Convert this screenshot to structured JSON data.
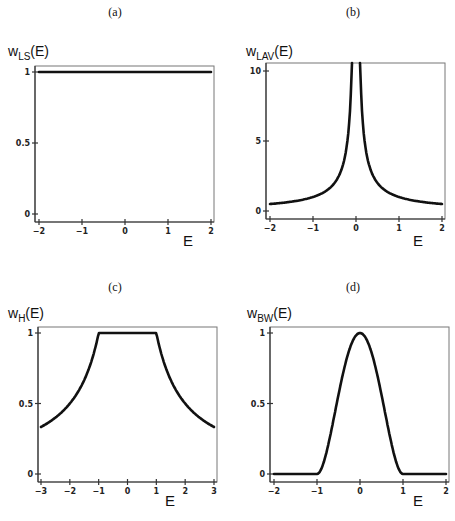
{
  "chart_data": [
    {
      "id": "a",
      "panel_label": "(a)",
      "type": "line",
      "title": "",
      "ylabel_main": "w",
      "ylabel_sub": "LS",
      "ylabel_arg": "(E)",
      "xlabel": "E",
      "xlim": [
        -2,
        2
      ],
      "ylim": [
        0,
        1.05
      ],
      "xticks": [
        "-2",
        "-1",
        "0",
        "1",
        "2"
      ],
      "yticks": [
        "0",
        "0.5",
        "1"
      ],
      "grid": false,
      "series": [
        {
          "name": "w_LS(E)",
          "x": [
            -2,
            -1,
            0,
            1,
            2
          ],
          "y": [
            1,
            1,
            1,
            1,
            1
          ]
        }
      ]
    },
    {
      "id": "b",
      "panel_label": "(b)",
      "type": "line",
      "title": "",
      "ylabel_main": "w",
      "ylabel_sub": "LAV",
      "ylabel_arg": "(E)",
      "xlabel": "E",
      "xlim": [
        -2,
        2
      ],
      "ylim": [
        0,
        10.5
      ],
      "xticks": [
        "-2",
        "-1",
        "0",
        "1",
        "2"
      ],
      "yticks": [
        "0",
        "5",
        "10"
      ],
      "grid": false,
      "series": [
        {
          "name": "w_LAV(E) = 1/|E|",
          "x": [
            -2,
            -1.5,
            -1,
            -0.75,
            -0.5,
            -0.3,
            -0.2,
            -0.1,
            0.1,
            0.2,
            0.3,
            0.5,
            0.75,
            1,
            1.5,
            2
          ],
          "y": [
            0.5,
            0.67,
            1,
            1.33,
            2,
            3.33,
            5,
            10,
            10,
            5,
            3.33,
            2,
            1.33,
            1,
            0.67,
            0.5
          ]
        }
      ]
    },
    {
      "id": "c",
      "panel_label": "(c)",
      "type": "line",
      "title": "",
      "ylabel_main": "w",
      "ylabel_sub": "H",
      "ylabel_arg": "(E)",
      "xlabel": "E",
      "xlim": [
        -3,
        3
      ],
      "ylim": [
        0,
        1.05
      ],
      "xticks": [
        "-3",
        "-2",
        "-1",
        "0",
        "1",
        "2",
        "3"
      ],
      "yticks": [
        "0",
        "0.5",
        "1"
      ],
      "grid": false,
      "series": [
        {
          "name": "w_H(E)",
          "x": [
            -3,
            -2.5,
            -2,
            -1.5,
            -1,
            0,
            1,
            1.5,
            2,
            2.5,
            3
          ],
          "y": [
            0.33,
            0.4,
            0.5,
            0.67,
            1,
            1,
            1,
            0.67,
            0.5,
            0.4,
            0.33
          ]
        }
      ]
    },
    {
      "id": "d",
      "panel_label": "(d)",
      "type": "line",
      "title": "",
      "ylabel_main": "w",
      "ylabel_sub": "BW",
      "ylabel_arg": "(E)",
      "xlabel": "E",
      "xlim": [
        -2,
        2
      ],
      "ylim": [
        0,
        1.05
      ],
      "xticks": [
        "-2",
        "-1",
        "0",
        "1",
        "2"
      ],
      "yticks": [
        "0",
        "0.5",
        "1"
      ],
      "grid": false,
      "series": [
        {
          "name": "w_BW(E) = (1-E^2)^2",
          "x": [
            -2,
            -1,
            -0.8,
            -0.6,
            -0.4,
            -0.2,
            0,
            0.2,
            0.4,
            0.6,
            0.8,
            1,
            2
          ],
          "y": [
            0,
            0,
            0.13,
            0.41,
            0.71,
            0.92,
            1,
            0.92,
            0.71,
            0.41,
            0.13,
            0,
            0
          ]
        }
      ]
    }
  ]
}
